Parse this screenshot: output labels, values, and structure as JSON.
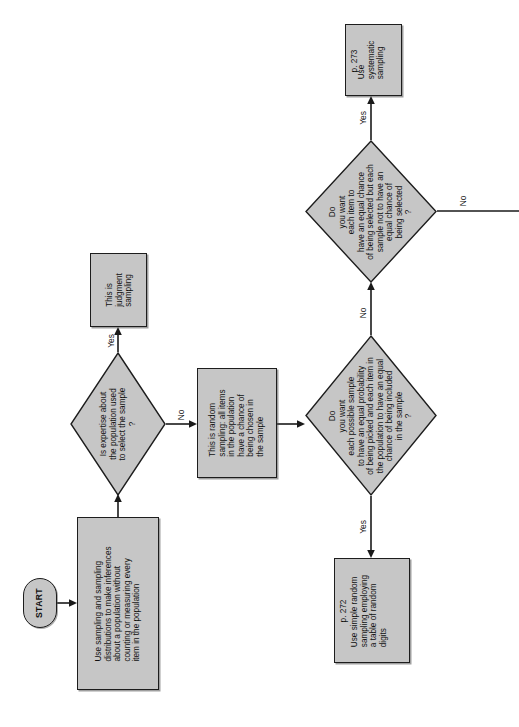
{
  "diagram": {
    "orientation": "rotated-90-ccw",
    "fill_color": "#c6c6c6",
    "stroke_color": "#1a1a1a",
    "background_color": "#ffffff"
  },
  "nodes": {
    "start": {
      "label": "START",
      "type": "terminator"
    },
    "intro": {
      "label": "Use sampling and sampling\ndistributions to make inferences\nabout a population without\ncounting or measuring every\nitem in the population",
      "type": "process"
    },
    "decision_expertise": {
      "label": "Is expertise about\nthe population used\nto select the sample\n?",
      "type": "decision"
    },
    "judgment": {
      "label": "This is\njudgment\nsampling",
      "type": "process"
    },
    "random_note": {
      "label": "This is random\nsampling: all items\nin the population\nhave a chance of\nbeing chosen in\nthe sample",
      "type": "process"
    },
    "decision_simple_random": {
      "label": "Do\nyou want\neach possible sample\nto have an equal probability\nof being picked and each item in\nthe population to have an equal\nchance of being included\nin the sample\n?",
      "type": "decision"
    },
    "simple_random": {
      "label": "Use simple random\nsampling employing\na table of random\ndigits",
      "page_ref": "p. 272",
      "type": "process"
    },
    "decision_systematic": {
      "label": "Do\nyou want\neach item to\nhave an equal chance\nof being selected but each\nsample not to have an\nequal chance of\nbeing selected\n?",
      "type": "decision"
    },
    "systematic": {
      "label": "Use\nsystematic\nsampling",
      "page_ref": "p. 273",
      "type": "process"
    }
  },
  "edges": {
    "expertise_yes": "Yes",
    "expertise_no": "No",
    "simple_random_yes": "Yes",
    "simple_random_no": "No",
    "systematic_yes": "Yes",
    "systematic_no": "No"
  }
}
